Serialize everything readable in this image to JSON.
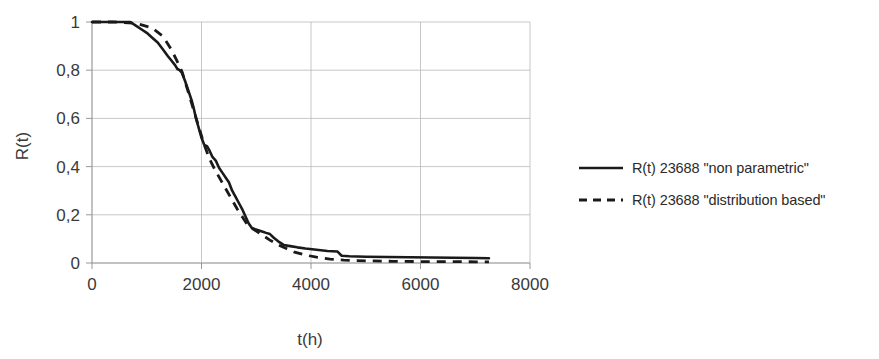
{
  "chart_data": {
    "type": "line",
    "title": "",
    "xlabel": "t(h)",
    "ylabel": "R(t)",
    "xlim": [
      0,
      8000
    ],
    "ylim": [
      0,
      1
    ],
    "grid": true,
    "legend_position": "right",
    "x_ticks": [
      "0",
      "2000",
      "4000",
      "6000",
      "8000"
    ],
    "x_tick_values": [
      0,
      2000,
      4000,
      6000,
      8000
    ],
    "y_ticks": [
      "0",
      "0,2",
      "0,4",
      "0,6",
      "0,8",
      "1"
    ],
    "y_tick_values": [
      0,
      0.2,
      0.4,
      0.6,
      0.8,
      1
    ],
    "decimal_separator": ",",
    "series": [
      {
        "name": "R(t) 23688 \"non parametric\"",
        "style": "solid",
        "color": "#1a1a1a",
        "x": [
          0,
          250,
          500,
          700,
          800,
          900,
          1000,
          1100,
          1200,
          1300,
          1380,
          1450,
          1520,
          1560,
          1600,
          1640,
          1700,
          1760,
          1820,
          1860,
          1900,
          1950,
          2000,
          2050,
          2100,
          2150,
          2200,
          2260,
          2320,
          2380,
          2440,
          2500,
          2560,
          2620,
          2680,
          2740,
          2800,
          2860,
          2920,
          2980,
          3050,
          3120,
          3180,
          3250,
          3320,
          3400,
          3500,
          3620,
          3750,
          3900,
          4100,
          4300,
          4480,
          4560,
          4700,
          5000,
          5400,
          5800,
          6200,
          6600,
          7000,
          7250
        ],
        "y": [
          1.0,
          1.0,
          1.0,
          1.0,
          0.985,
          0.97,
          0.955,
          0.935,
          0.915,
          0.885,
          0.86,
          0.84,
          0.82,
          0.805,
          0.8,
          0.79,
          0.755,
          0.715,
          0.675,
          0.64,
          0.6,
          0.56,
          0.52,
          0.49,
          0.485,
          0.465,
          0.44,
          0.425,
          0.395,
          0.375,
          0.355,
          0.335,
          0.3,
          0.275,
          0.25,
          0.225,
          0.195,
          0.165,
          0.145,
          0.14,
          0.135,
          0.13,
          0.125,
          0.12,
          0.105,
          0.09,
          0.075,
          0.07,
          0.065,
          0.06,
          0.055,
          0.05,
          0.048,
          0.03,
          0.028,
          0.026,
          0.025,
          0.024,
          0.023,
          0.022,
          0.021,
          0.02
        ]
      },
      {
        "name": "R(t) 23688 \"distribution based\"",
        "style": "dashed",
        "color": "#1a1a1a",
        "x": [
          0,
          400,
          800,
          1100,
          1300,
          1450,
          1550,
          1650,
          1750,
          1850,
          1950,
          2050,
          2150,
          2250,
          2350,
          2450,
          2550,
          2650,
          2750,
          2850,
          2950,
          3050,
          3150,
          3250,
          3400,
          3550,
          3700,
          3900,
          4100,
          4350,
          4600,
          5000,
          5500,
          6000,
          6500,
          7000,
          7250
        ],
        "y": [
          1.0,
          1.0,
          0.995,
          0.975,
          0.94,
          0.885,
          0.84,
          0.79,
          0.715,
          0.64,
          0.565,
          0.49,
          0.43,
          0.385,
          0.345,
          0.305,
          0.265,
          0.225,
          0.19,
          0.155,
          0.14,
          0.125,
          0.11,
          0.095,
          0.075,
          0.06,
          0.045,
          0.033,
          0.024,
          0.016,
          0.012,
          0.009,
          0.007,
          0.006,
          0.006,
          0.005,
          0.005
        ]
      }
    ]
  },
  "legend": {
    "items": [
      {
        "label": "R(t) 23688 \"non parametric\"",
        "style": "solid"
      },
      {
        "label": "R(t) 23688 \"distribution based\"",
        "style": "dashed"
      }
    ]
  },
  "axes": {
    "x_title": "t(h)",
    "y_title": "R(t)"
  }
}
